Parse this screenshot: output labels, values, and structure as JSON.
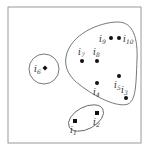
{
  "diagram": {
    "frame": {
      "x": 8,
      "y": 7,
      "w": 133,
      "h": 136,
      "stroke": "#9a9a9a"
    },
    "clusters": [
      {
        "name": "cluster-i6",
        "members": [
          "i6"
        ]
      },
      {
        "name": "cluster-main",
        "members": [
          "i3",
          "i4",
          "i5",
          "i7",
          "i8",
          "i9",
          "i10"
        ]
      },
      {
        "name": "cluster-i1-i2",
        "members": [
          "i1",
          "i2"
        ]
      }
    ],
    "nodes": [
      {
        "id": "i1",
        "base": "i",
        "sub": "1",
        "shape": "square",
        "x": 75,
        "y": 121,
        "lx": 70,
        "ly": 133
      },
      {
        "id": "i2",
        "base": "i",
        "sub": "2",
        "shape": "square",
        "x": 97,
        "y": 113,
        "lx": 93,
        "ly": 125
      },
      {
        "id": "i3",
        "base": "i",
        "sub": "3",
        "shape": "dot",
        "x": 126,
        "y": 98,
        "lx": 121,
        "ly": 93
      },
      {
        "id": "i4",
        "base": "i",
        "sub": "4",
        "shape": "dot",
        "x": 97,
        "y": 83,
        "lx": 93,
        "ly": 95
      },
      {
        "id": "i5",
        "base": "i",
        "sub": "5",
        "shape": "dot",
        "x": 119,
        "y": 76,
        "lx": 114,
        "ly": 88
      },
      {
        "id": "i6",
        "base": "i",
        "sub": "6",
        "shape": "diamond",
        "x": 45,
        "y": 68,
        "lx": 34,
        "ly": 72
      },
      {
        "id": "i7",
        "base": "i",
        "sub": "7",
        "shape": "dot",
        "x": 82,
        "y": 61,
        "lx": 78,
        "ly": 55
      },
      {
        "id": "i8",
        "base": "i",
        "sub": "8",
        "shape": "dot",
        "x": 97,
        "y": 61,
        "lx": 93,
        "ly": 55
      },
      {
        "id": "i9",
        "base": "i",
        "sub": "9",
        "shape": "dot",
        "x": 111,
        "y": 38,
        "lx": 99,
        "ly": 42
      },
      {
        "id": "i10",
        "base": "i",
        "sub": "10",
        "shape": "dot",
        "x": 119,
        "y": 38,
        "lx": 123,
        "ly": 42
      }
    ]
  }
}
